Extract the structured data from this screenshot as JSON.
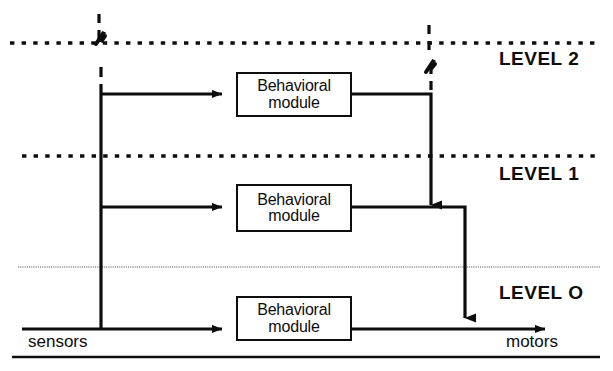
{
  "diagram": {
    "canvas": {
      "width": 613,
      "height": 371,
      "background": "#ffffff"
    },
    "ink_color": "#0d0d0d",
    "hairline_color": "#8c8c8c",
    "levels": [
      {
        "id": "level-2",
        "label": "LEVEL 2",
        "label_x": 499,
        "label_y": 48,
        "separator_y": 43,
        "separator_style": "dotted-bold"
      },
      {
        "id": "level-1",
        "label": "LEVEL 1",
        "label_y": 163,
        "label_x": 499,
        "separator_y": 156,
        "separator_style": "dotted-bold"
      },
      {
        "id": "level-0",
        "label": "LEVEL O",
        "label_x": 499,
        "label_y": 282,
        "separator_y": 267,
        "separator_style": "hairline-wavy"
      }
    ],
    "modules": [
      {
        "id": "module-level-2",
        "line1": "Behavioral",
        "line2": "module",
        "x": 236,
        "y": 72,
        "width": 116,
        "height": 45
      },
      {
        "id": "module-level-1",
        "line1": "Behavioral",
        "line2": "module",
        "x": 236,
        "y": 184,
        "width": 116,
        "height": 48
      },
      {
        "id": "module-level-0",
        "line1": "Behavioral",
        "line2": "module",
        "x": 236,
        "y": 296,
        "width": 116,
        "height": 45
      }
    ],
    "io": {
      "sensors_label": "sensors",
      "sensors_label_x": 28,
      "sensors_label_y": 332,
      "motors_label": "motors",
      "motors_label_x": 506,
      "motors_label_y": 332
    },
    "connections": [
      {
        "id": "sensor-bus-vertical",
        "from": "sensors-bus",
        "to": "level-2-branch"
      },
      {
        "id": "sensor-to-module-2",
        "from": "sensor-bus",
        "to": "module-level-2",
        "arrow": true
      },
      {
        "id": "sensor-to-module-1",
        "from": "sensor-bus",
        "to": "module-level-1",
        "arrow": true
      },
      {
        "id": "sensor-to-module-0",
        "from": "sensor-bus",
        "to": "module-level-0",
        "arrow": true
      },
      {
        "id": "module-2-to-level-1-output",
        "from": "module-level-2",
        "to": "level-1-output-line",
        "arrow": true
      },
      {
        "id": "module-1-to-level-0-output",
        "from": "module-level-1",
        "to": "level-0-output-line",
        "arrow": true
      },
      {
        "id": "module-0-to-motors",
        "from": "module-level-0",
        "to": "motors",
        "arrow": true
      }
    ],
    "continuation_marks": [
      {
        "id": "sensor-bus-continuation",
        "x": 101,
        "style": "broken-dashed-up"
      },
      {
        "id": "level-2-output-continuation",
        "x": 431,
        "style": "broken-dashed-up"
      }
    ],
    "footer_rule": {
      "y": 357,
      "x1": 12,
      "x2": 600
    }
  }
}
